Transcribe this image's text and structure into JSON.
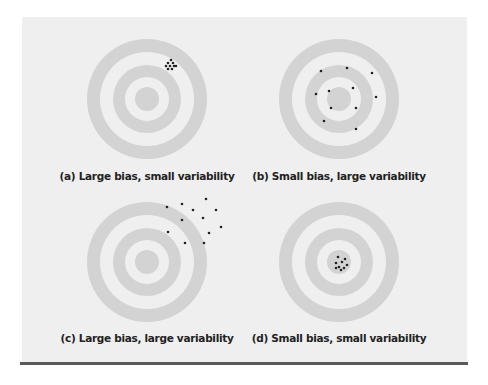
{
  "figure": {
    "colors": {
      "background": "#efefef",
      "ring": "#d3d3d3",
      "dot": "#222222",
      "rule": "#5a5a5a"
    },
    "panels": [
      {
        "id": "a",
        "caption": "(a) Large bias, small variability",
        "center": [
          147,
          99
        ],
        "caption_pos": [
          147,
          177
        ],
        "dots": [
          [
            171,
            60
          ],
          [
            168,
            63
          ],
          [
            173,
            63
          ],
          [
            166,
            66
          ],
          [
            170,
            66
          ],
          [
            174,
            66
          ],
          [
            168,
            69
          ],
          [
            172,
            69
          ],
          [
            176,
            66
          ]
        ]
      },
      {
        "id": "b",
        "caption": "(b) Small bias, large variability",
        "center": [
          339,
          99
        ],
        "caption_pos": [
          339,
          177
        ],
        "dots": [
          [
            321,
            71
          ],
          [
            347,
            68
          ],
          [
            372,
            73
          ],
          [
            316,
            94
          ],
          [
            329,
            91
          ],
          [
            353,
            88
          ],
          [
            376,
            97
          ],
          [
            331,
            108
          ],
          [
            356,
            108
          ],
          [
            324,
            121
          ],
          [
            356,
            129
          ]
        ]
      },
      {
        "id": "c",
        "caption": "(c) Large bias, large variability",
        "center": [
          147,
          262
        ],
        "caption_pos": [
          147,
          339
        ],
        "dots": [
          [
            167,
            207
          ],
          [
            182,
            204
          ],
          [
            206,
            199
          ],
          [
            193,
            210
          ],
          [
            216,
            210
          ],
          [
            182,
            220
          ],
          [
            203,
            218
          ],
          [
            221,
            227
          ],
          [
            168,
            232
          ],
          [
            209,
            233
          ],
          [
            185,
            243
          ],
          [
            204,
            243
          ]
        ]
      },
      {
        "id": "d",
        "caption": "(d) Small bias, small variability",
        "center": [
          339,
          262
        ],
        "caption_pos": [
          339,
          339
        ],
        "dots": [
          [
            338,
            257
          ],
          [
            345,
            259
          ],
          [
            342,
            262
          ],
          [
            336,
            263
          ],
          [
            347,
            265
          ],
          [
            339,
            267
          ],
          [
            344,
            268
          ],
          [
            341,
            270
          ],
          [
            336,
            268
          ]
        ]
      }
    ]
  }
}
